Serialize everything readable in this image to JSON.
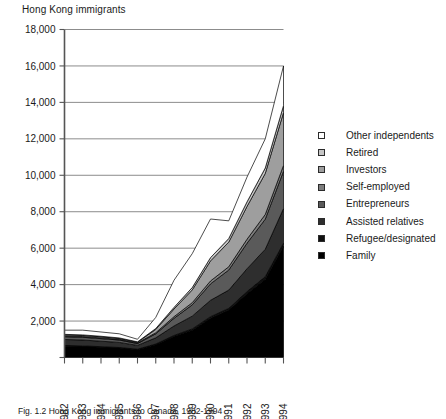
{
  "chart_data": {
    "type": "area",
    "title": "Hong Kong immigrants",
    "xlabel": "",
    "ylabel": "",
    "ylim": [
      0,
      18000
    ],
    "ytick_step": 2000,
    "grid": true,
    "stacked": true,
    "legend_position": "right",
    "x": [
      1982,
      1983,
      1984,
      1985,
      1986,
      1987,
      1988,
      1989,
      1990,
      1991,
      1992,
      1993,
      1994
    ],
    "categories": [
      "1982",
      "1983",
      "1984",
      "1985",
      "1986",
      "1987",
      "1988",
      "1989",
      "1990",
      "1991",
      "1992",
      "1993",
      "1994"
    ],
    "ytick_labels": [
      "0",
      "2,000",
      "4,000",
      "6,000",
      "8,000",
      "10,000",
      "12,000",
      "14,000",
      "16,000",
      "18,000"
    ],
    "series": [
      {
        "name": "Family",
        "color": "#000000",
        "values": [
          620,
          600,
          560,
          520,
          430,
          700,
          1150,
          1500,
          2150,
          2600,
          3500,
          4300,
          6100
        ]
      },
      {
        "name": "Refugee/designated",
        "color": "#101010",
        "values": [
          40,
          40,
          35,
          30,
          25,
          40,
          60,
          70,
          90,
          100,
          120,
          140,
          170
        ]
      },
      {
        "name": "Assisted relatives",
        "color": "#2e2e2e",
        "values": [
          330,
          320,
          300,
          280,
          210,
          340,
          520,
          700,
          900,
          1000,
          1250,
          1500,
          1900
        ]
      },
      {
        "name": "Entrepreneurs",
        "color": "#5a5a5a",
        "values": [
          150,
          150,
          140,
          130,
          100,
          220,
          420,
          620,
          900,
          1100,
          1400,
          1650,
          2050
        ]
      },
      {
        "name": "Self-employed",
        "color": "#7d7d7d",
        "values": [
          40,
          40,
          40,
          35,
          30,
          60,
          90,
          120,
          160,
          180,
          220,
          260,
          320
        ]
      },
      {
        "name": "Investors",
        "color": "#9e9e9e",
        "values": [
          60,
          60,
          60,
          55,
          45,
          180,
          420,
          700,
          1100,
          1350,
          1800,
          2250,
          2900
        ]
      },
      {
        "name": "Retired",
        "color": "#c6c6c6",
        "values": [
          30,
          30,
          30,
          25,
          20,
          50,
          90,
          130,
          180,
          200,
          250,
          300,
          380
        ]
      },
      {
        "name": "Other independents",
        "color": "#ffffff",
        "values": [
          230,
          260,
          235,
          225,
          140,
          610,
          1490,
          1860,
          2120,
          970,
          1360,
          1600,
          2180
        ]
      }
    ],
    "legend_order_top_to_bottom": [
      "Other independents",
      "Retired",
      "Investors",
      "Self-employed",
      "Entrepreneurs",
      "Assisted relatives",
      "Refugee/designated",
      "Family"
    ]
  },
  "legend": {
    "items": [
      {
        "label": "Other independents",
        "swatch": "#ffffff"
      },
      {
        "label": "Retired",
        "swatch": "#c6c6c6"
      },
      {
        "label": "Investors",
        "swatch": "#9e9e9e"
      },
      {
        "label": "Self-employed",
        "swatch": "#7d7d7d"
      },
      {
        "label": "Entrepreneurs",
        "swatch": "#5a5a5a"
      },
      {
        "label": "Assisted relatives",
        "swatch": "#2e2e2e"
      },
      {
        "label": "Refugee/designated",
        "swatch": "#101010"
      },
      {
        "label": "Family",
        "swatch": "#000000"
      }
    ]
  },
  "caption": {
    "text": "Fig. 1.2   Hong Kong immigrants to Canada, 1982-1994"
  }
}
